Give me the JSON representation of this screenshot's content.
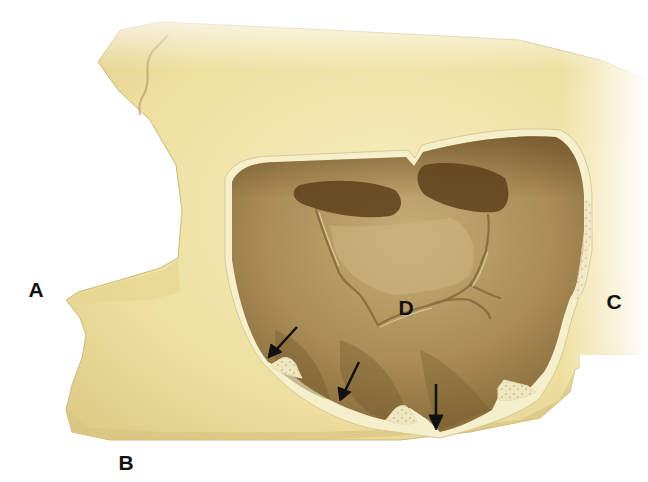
{
  "figure": {
    "colors": {
      "background": "#ffffff",
      "bone_light": "#f3e9b8",
      "bone_mid": "#e6d79a",
      "bone_shadow": "#c9b57a",
      "sinus_wall_rim": "#f6efcc",
      "sinus_floor_light": "#b59c68",
      "sinus_dark": "#6e5226",
      "sinus_recess": "#5a3f1a",
      "septum_line": "#8a7142",
      "arrow": "#111111",
      "label": "#111111"
    },
    "labels": [
      {
        "id": "A",
        "text": "A",
        "x": 36,
        "y": 289
      },
      {
        "id": "B",
        "text": "B",
        "x": 126,
        "y": 462
      },
      {
        "id": "C",
        "text": "C",
        "x": 614,
        "y": 301
      },
      {
        "id": "D",
        "text": "D",
        "x": 406,
        "y": 307
      }
    ],
    "arrows": [
      {
        "from": [
          297,
          327
        ],
        "to": [
          268,
          358
        ]
      },
      {
        "from": [
          359,
          362
        ],
        "to": [
          340,
          401
        ]
      },
      {
        "from": [
          436,
          384
        ],
        "to": [
          436,
          430
        ]
      }
    ]
  }
}
